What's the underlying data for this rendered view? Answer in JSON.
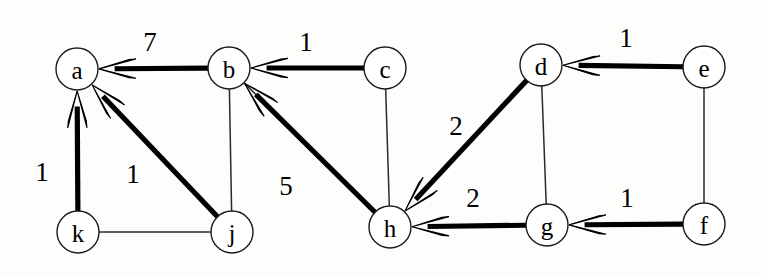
{
  "figure": {
    "kind": "weighted-directed-graph",
    "background_color": "#fdfdfb",
    "ink_color": "#000000",
    "width": 762,
    "height": 276
  },
  "nodes": [
    {
      "id": "a",
      "label": "a",
      "cx": 77,
      "cy": 69,
      "r": 21
    },
    {
      "id": "b",
      "label": "b",
      "cx": 229,
      "cy": 68,
      "r": 21
    },
    {
      "id": "c",
      "label": "c",
      "cx": 385,
      "cy": 68,
      "r": 21
    },
    {
      "id": "d",
      "label": "d",
      "cx": 541,
      "cy": 65,
      "r": 21
    },
    {
      "id": "e",
      "label": "e",
      "cx": 704,
      "cy": 67,
      "r": 21
    },
    {
      "id": "f",
      "label": "f",
      "cx": 704,
      "cy": 224,
      "r": 21
    },
    {
      "id": "g",
      "label": "g",
      "cx": 547,
      "cy": 225,
      "r": 21
    },
    {
      "id": "h",
      "label": "h",
      "cx": 390,
      "cy": 227,
      "r": 21
    },
    {
      "id": "j",
      "label": "j",
      "cx": 232,
      "cy": 232,
      "r": 21
    },
    {
      "id": "k",
      "label": "k",
      "cx": 78,
      "cy": 232,
      "r": 21
    }
  ],
  "directed_edges": [
    {
      "id": "b-a",
      "from": "b",
      "to": "a",
      "weight": "7",
      "label_x": 150,
      "label_y": 42
    },
    {
      "id": "c-b",
      "from": "c",
      "to": "b",
      "weight": "1",
      "label_x": 306,
      "label_y": 42
    },
    {
      "id": "e-d",
      "from": "e",
      "to": "d",
      "weight": "1",
      "label_x": 626,
      "label_y": 38
    },
    {
      "id": "k-a",
      "from": "k",
      "to": "a",
      "weight": "1",
      "label_x": 42,
      "label_y": 172
    },
    {
      "id": "j-a",
      "from": "j",
      "to": "a",
      "weight": "1",
      "label_x": 133,
      "label_y": 174
    },
    {
      "id": "h-b",
      "from": "h",
      "to": "b",
      "weight": "5",
      "label_x": 286,
      "label_y": 186
    },
    {
      "id": "d-h",
      "from": "d",
      "to": "h",
      "weight": "2",
      "label_x": 456,
      "label_y": 126
    },
    {
      "id": "g-h",
      "from": "g",
      "to": "h",
      "weight": "2",
      "label_x": 473,
      "label_y": 198
    },
    {
      "id": "f-g",
      "from": "f",
      "to": "g",
      "weight": "1",
      "label_x": 627,
      "label_y": 198
    }
  ],
  "undirected_edges": [
    {
      "id": "b-h-thin",
      "from": "b",
      "to": "h"
    },
    {
      "id": "c-h-thin",
      "from": "c",
      "to": "h"
    },
    {
      "id": "d-g-thin",
      "from": "d",
      "to": "g"
    },
    {
      "id": "e-f-thin",
      "from": "e",
      "to": "f"
    },
    {
      "id": "k-j-thin",
      "from": "k",
      "to": "j"
    },
    {
      "id": "b-j-thin",
      "from": "b",
      "to": "j"
    }
  ],
  "chart_data": {
    "type": "diagram",
    "title": "",
    "vertices": [
      "a",
      "b",
      "c",
      "d",
      "e",
      "f",
      "g",
      "h",
      "j",
      "k"
    ],
    "weighted_arcs": [
      {
        "source": "b",
        "target": "a",
        "weight": 7
      },
      {
        "source": "c",
        "target": "b",
        "weight": 1
      },
      {
        "source": "e",
        "target": "d",
        "weight": 1
      },
      {
        "source": "k",
        "target": "a",
        "weight": 1
      },
      {
        "source": "j",
        "target": "a",
        "weight": 1
      },
      {
        "source": "h",
        "target": "b",
        "weight": 5
      },
      {
        "source": "d",
        "target": "h",
        "weight": 2
      },
      {
        "source": "g",
        "target": "h",
        "weight": 2
      },
      {
        "source": "f",
        "target": "g",
        "weight": 1
      }
    ],
    "plain_edges": [
      {
        "a": "b",
        "b": "h"
      },
      {
        "a": "c",
        "b": "h"
      },
      {
        "a": "d",
        "b": "g"
      },
      {
        "a": "e",
        "b": "f"
      },
      {
        "a": "k",
        "b": "j"
      },
      {
        "a": "b",
        "b": "j"
      }
    ]
  }
}
